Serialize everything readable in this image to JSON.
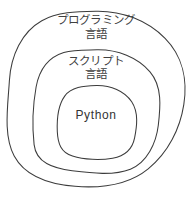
{
  "diagram": {
    "type": "nested-set-venn",
    "background_color": "#ffffff",
    "stroke_color": "#3c3c3c",
    "stroke_width": 1,
    "sets": [
      {
        "id": "outer",
        "name": "programming-language-set",
        "label_line1": "プログラミング",
        "label_line2": "言語",
        "center_x": 96,
        "center_y": 99,
        "radius": 88
      },
      {
        "id": "middle",
        "name": "scripting-language-set",
        "label_line1": "スクリプト",
        "label_line2": "言語",
        "center_x": 96,
        "center_y": 111,
        "radius": 62
      },
      {
        "id": "inner",
        "name": "python-set",
        "label_line1": "Python",
        "label_line2": "",
        "center_x": 96,
        "center_y": 122,
        "radius": 39
      }
    ]
  }
}
